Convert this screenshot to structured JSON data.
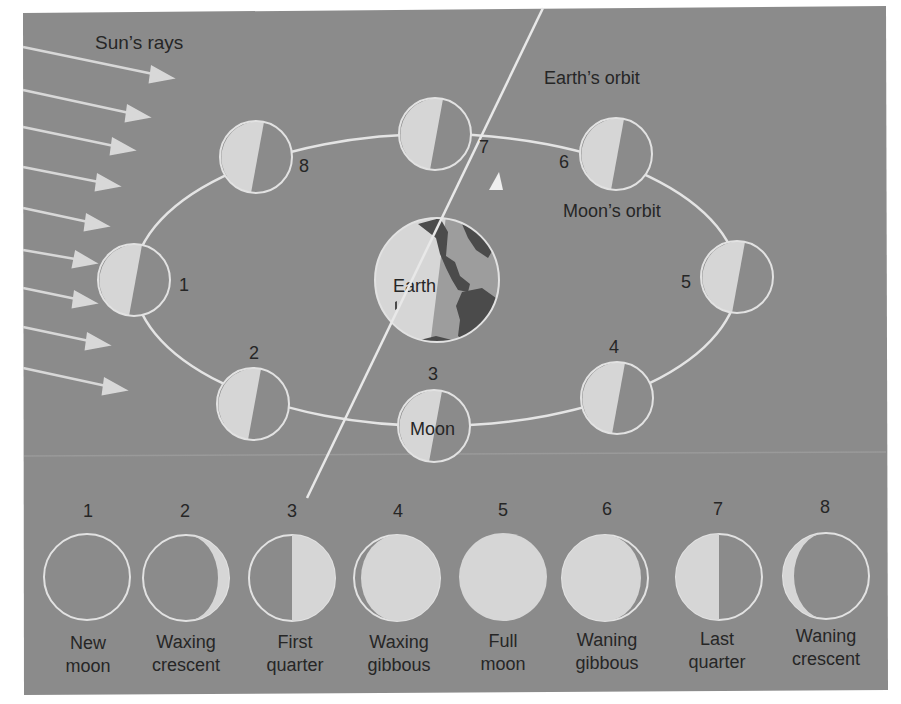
{
  "diagram": {
    "labels": {
      "sun_rays": "Sun’s rays",
      "earths_orbit": "Earth’s orbit",
      "moons_orbit": "Moon’s orbit",
      "earth": "Earth",
      "moon": "Moon"
    },
    "colors": {
      "background": "#8b8b8b",
      "lit": "#d6d6d6",
      "outline": "#e2e2e2",
      "continent": "#4b4b4b",
      "earth_dark": "#9d9d9d",
      "text": "#262626"
    },
    "orbit_positions": [
      {
        "number": "1"
      },
      {
        "number": "2"
      },
      {
        "number": "3"
      },
      {
        "number": "4"
      },
      {
        "number": "5"
      },
      {
        "number": "6"
      },
      {
        "number": "7"
      },
      {
        "number": "8"
      }
    ],
    "phases": [
      {
        "number": "1",
        "line1": "New",
        "line2": "moon"
      },
      {
        "number": "2",
        "line1": "Waxing",
        "line2": "crescent"
      },
      {
        "number": "3",
        "line1": "First",
        "line2": "quarter"
      },
      {
        "number": "4",
        "line1": "Waxing",
        "line2": "gibbous"
      },
      {
        "number": "5",
        "line1": "Full",
        "line2": "moon"
      },
      {
        "number": "6",
        "line1": "Waning",
        "line2": "gibbous"
      },
      {
        "number": "7",
        "line1": "Last",
        "line2": "quarter"
      },
      {
        "number": "8",
        "line1": "Waning",
        "line2": "crescent"
      }
    ]
  }
}
